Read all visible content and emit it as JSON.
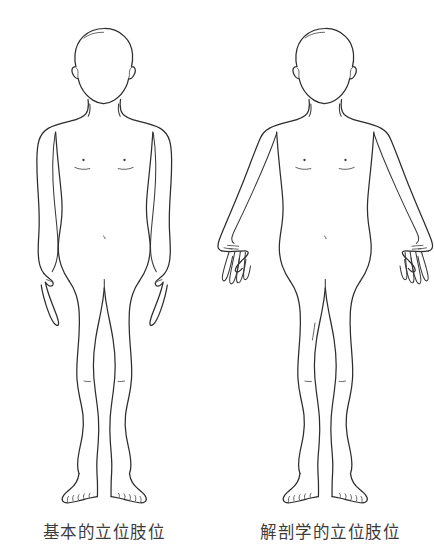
{
  "page": {
    "background_color": "#ffffff",
    "line_color": "#2e2c2d",
    "text_color": "#3b3b3b",
    "width": 434,
    "height": 549
  },
  "figures": [
    {
      "id": "basic-standing-position",
      "caption": "基本的立位肢位",
      "arms": "hanging at sides, palms facing the thighs",
      "view": "anterior",
      "sex_presentation": "neutral"
    },
    {
      "id": "anatomical-standing-position",
      "caption": "解剖学的立位肢位",
      "arms": "abducted slightly, forearms supinated, palms facing forward",
      "view": "anterior",
      "sex_presentation": "neutral"
    }
  ],
  "captions": {
    "left": "基本的立位肢位",
    "right": "解剖学的立位肢位"
  },
  "icons": {
    "human-figure": "human-figure-outline"
  }
}
